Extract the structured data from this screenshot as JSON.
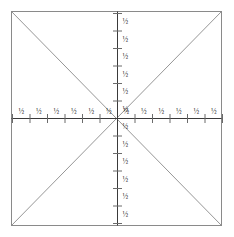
{
  "figure": {
    "title": "",
    "type": "geometric-diagram",
    "colors": {
      "background": "#ffffff",
      "frame_stroke": "#8a8a8a",
      "diagonal_stroke": "#8a8a8a",
      "axis_stroke": "#3a3a3a",
      "tick_stroke": "#6b6b6b",
      "label_text": "#2b2b2b"
    },
    "geometry": {
      "square": {
        "left": 11,
        "top": 11,
        "right": 222,
        "bottom": 226
      },
      "center": {
        "x": 117,
        "y": 118
      },
      "tick_spacing": 17.5,
      "ticks_per_arm": 6
    }
  },
  "chart_data": {
    "type": "scatter",
    "title": "",
    "xlabel": "",
    "ylabel": "",
    "grid": false,
    "legend": null,
    "annotations": [
      "square frame",
      "diagonal top-left to bottom-right",
      "diagonal bottom-left to top-right",
      "horizontal axis through center",
      "vertical axis through center"
    ]
  },
  "axes": {
    "x_positive": {
      "name": "right-arm",
      "ticks": [
        {
          "index": 1,
          "label": "½"
        },
        {
          "index": 2,
          "label": "½"
        },
        {
          "index": 3,
          "label": "½"
        },
        {
          "index": 4,
          "label": "½"
        },
        {
          "index": 5,
          "label": "½"
        },
        {
          "index": 6,
          "label": "½"
        }
      ]
    },
    "x_negative": {
      "name": "left-arm",
      "ticks": [
        {
          "index": 1,
          "label": "½"
        },
        {
          "index": 2,
          "label": "½"
        },
        {
          "index": 3,
          "label": "½"
        },
        {
          "index": 4,
          "label": "½"
        },
        {
          "index": 5,
          "label": "½"
        },
        {
          "index": 6,
          "label": "½"
        }
      ]
    },
    "y_positive": {
      "name": "top-arm",
      "ticks": [
        {
          "index": 1,
          "label": "½"
        },
        {
          "index": 2,
          "label": "½"
        },
        {
          "index": 3,
          "label": "½"
        },
        {
          "index": 4,
          "label": "½"
        },
        {
          "index": 5,
          "label": "½"
        },
        {
          "index": 6,
          "label": "½"
        }
      ]
    },
    "y_negative": {
      "name": "bottom-arm",
      "ticks": [
        {
          "index": 1,
          "label": "½"
        },
        {
          "index": 2,
          "label": "½"
        },
        {
          "index": 3,
          "label": "½"
        },
        {
          "index": 4,
          "label": "½"
        },
        {
          "index": 5,
          "label": "½"
        },
        {
          "index": 6,
          "label": "½"
        }
      ]
    }
  }
}
